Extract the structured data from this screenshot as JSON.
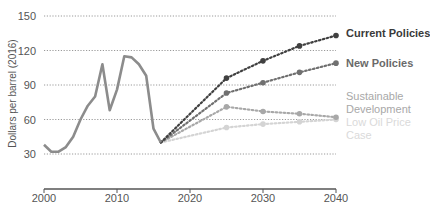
{
  "chart_data": {
    "type": "line",
    "title": "",
    "xlabel": "",
    "ylabel": "Dollars per barrel (2016)",
    "xlim": [
      2000,
      2040
    ],
    "ylim": [
      0,
      160
    ],
    "x_ticks": [
      2000,
      2010,
      2020,
      2030,
      2040
    ],
    "y_ticks": [
      30,
      60,
      90,
      120,
      150
    ],
    "grid": "horizontal dotted",
    "legend_position": "right, inline labels",
    "series": [
      {
        "name": "Historical",
        "style": "solid",
        "color": "#8c8c8c",
        "x": [
          2000,
          2001,
          2002,
          2003,
          2004,
          2005,
          2006,
          2007,
          2008,
          2009,
          2010,
          2011,
          2012,
          2013,
          2014,
          2015,
          2016
        ],
        "values": [
          38,
          32,
          32,
          36,
          45,
          60,
          72,
          80,
          108,
          68,
          86,
          115,
          114,
          108,
          98,
          52,
          40
        ]
      },
      {
        "name": "Current Policies",
        "style": "dotted",
        "color": "#404040",
        "x": [
          2016,
          2025,
          2030,
          2035,
          2040
        ],
        "values": [
          40,
          96,
          111,
          124,
          133
        ]
      },
      {
        "name": "New Policies",
        "style": "dotted",
        "color": "#707070",
        "x": [
          2016,
          2025,
          2030,
          2035,
          2040
        ],
        "values": [
          40,
          83,
          92,
          101,
          109
        ]
      },
      {
        "name": "Sustainable Development",
        "style": "dotted",
        "color": "#a8a8a8",
        "x": [
          2016,
          2025,
          2030,
          2035,
          2040
        ],
        "values": [
          40,
          71,
          67,
          65,
          62
        ]
      },
      {
        "name": "Low Oil Price Case",
        "style": "dotted",
        "color": "#d4d4d4",
        "x": [
          2016,
          2025,
          2030,
          2035,
          2040
        ],
        "values": [
          40,
          53,
          56,
          58,
          60
        ]
      }
    ]
  },
  "labels": {
    "ylabel": "Dollars per barrel (2016)",
    "current": "Current Policies",
    "new": "New Policies",
    "sustainable_1": "Sustainable",
    "sustainable_2": "Development",
    "lowoil_1": "Low Oil Price",
    "lowoil_2": "Case"
  }
}
